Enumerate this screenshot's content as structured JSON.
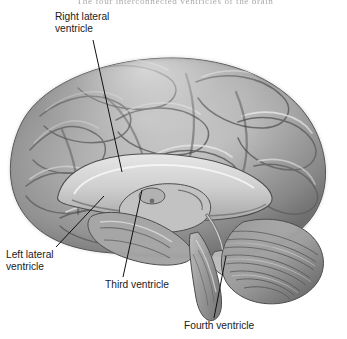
{
  "figure": {
    "caption": "The four interconnected ventricles of the brain",
    "background_color": "#ffffff",
    "ink_color": "#1a1a1a",
    "view": "lateral cutaway view of the human brain",
    "labels": [
      {
        "id": "right-lateral-ventricle",
        "text": "Right lateral\nventricle"
      },
      {
        "id": "left-lateral-ventricle",
        "text": "Left lateral\nventricle"
      },
      {
        "id": "third-ventricle",
        "text": "Third ventricle"
      },
      {
        "id": "fourth-ventricle",
        "text": "Fourth ventricle"
      }
    ],
    "structures": [
      "cerebrum",
      "cerebral cortex gyri",
      "corpus callosum",
      "lateral ventricle",
      "third ventricle",
      "fourth ventricle",
      "thalamus",
      "cerebellum",
      "brainstem"
    ]
  }
}
